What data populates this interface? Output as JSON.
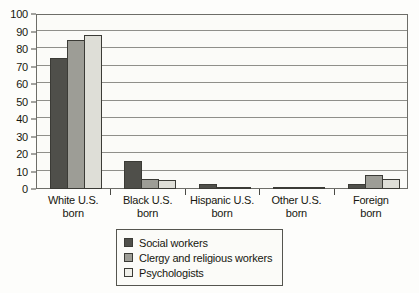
{
  "chart_data": {
    "type": "bar",
    "title": "",
    "subtitle": "",
    "xlabel": "",
    "ylabel": "",
    "ylim": [
      0,
      100
    ],
    "ytick_step": 10,
    "yticks": [
      0,
      10,
      20,
      30,
      40,
      50,
      60,
      70,
      80,
      90,
      100
    ],
    "grid": true,
    "legend_position": "bottom-center",
    "categories": [
      "White U.S. born",
      "Black U.S. born",
      "Hispanic U.S. born",
      "Other U.S. born",
      "Foreign born"
    ],
    "category_lines": [
      [
        "White U.S.",
        "born"
      ],
      [
        "Black U.S.",
        "born"
      ],
      [
        "Hispanic U.S.",
        "born"
      ],
      [
        "Other U.S.",
        "born"
      ],
      [
        "Foreign",
        "born"
      ]
    ],
    "series": [
      {
        "name": "Social workers",
        "color": "#4f4f4a",
        "values": [
          75,
          16,
          3,
          1,
          3
        ]
      },
      {
        "name": "Clergy and religious workers",
        "color": "#9d9d96",
        "values": [
          85,
          6,
          1,
          0.5,
          8
        ]
      },
      {
        "name": "Psychologists",
        "color": "#dedeD7",
        "values": [
          88,
          5,
          1,
          0.5,
          6
        ]
      }
    ]
  },
  "colors": {
    "series_1": "#4f4f4a",
    "series_2": "#9d9d96",
    "series_3": "#dedeD7",
    "axis": "#4a4a45",
    "grid": "#8f8f8a",
    "background": "#fdfdfb",
    "text": "#17170f"
  }
}
